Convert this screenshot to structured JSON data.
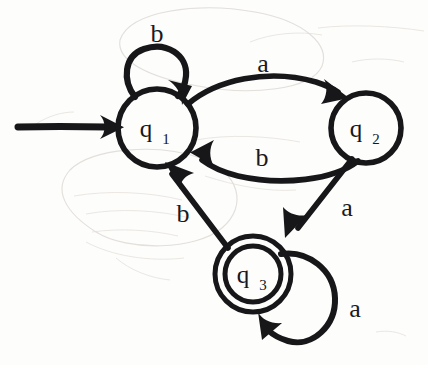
{
  "diagram": {
    "kind": "finite-state-automaton",
    "title": "",
    "ink_color": "#171619",
    "background_color": "#fdfdfc",
    "ghost_color": "#d9d4cf",
    "alphabet": [
      "a",
      "b"
    ],
    "start_state": "q1",
    "accepting_states": [
      "q3"
    ],
    "states": [
      {
        "id": "q1",
        "label": "q",
        "subscript": "1",
        "cx": 157,
        "cy": 128,
        "r": 39,
        "accepting": false,
        "is_start": true
      },
      {
        "id": "q2",
        "label": "q",
        "subscript": "2",
        "cx": 366,
        "cy": 128,
        "r": 35,
        "accepting": false,
        "is_start": false
      },
      {
        "id": "q3",
        "label": "q",
        "subscript": "3",
        "cx": 253,
        "cy": 274,
        "r": 38,
        "inner_r": 28,
        "accepting": true,
        "is_start": false
      }
    ],
    "transitions": [
      {
        "id": "t-q1-q1-b",
        "from": "q1",
        "to": "q1",
        "symbol": "b",
        "kind": "self-loop",
        "label_x": 157,
        "label_y": 42
      },
      {
        "id": "t-q1-q2-a",
        "from": "q1",
        "to": "q2",
        "symbol": "a",
        "kind": "arc-top",
        "label_x": 263,
        "label_y": 72
      },
      {
        "id": "t-q2-q1-b",
        "from": "q2",
        "to": "q1",
        "symbol": "b",
        "kind": "arc-bottom",
        "label_x": 262,
        "label_y": 166
      },
      {
        "id": "t-q2-q3-a",
        "from": "q2",
        "to": "q3",
        "symbol": "a",
        "kind": "straight",
        "label_x": 347,
        "label_y": 216
      },
      {
        "id": "t-q3-q1-b",
        "from": "q3",
        "to": "q1",
        "symbol": "b",
        "kind": "straight",
        "label_x": 183,
        "label_y": 222
      },
      {
        "id": "t-q3-q3-a",
        "from": "q3",
        "to": "q3",
        "symbol": "a",
        "kind": "self-loop",
        "label_x": 355,
        "label_y": 317
      }
    ],
    "start_arrow": {
      "id": "start-arrow",
      "x1": 18,
      "y1": 127,
      "x2": 118,
      "y2": 127
    }
  }
}
